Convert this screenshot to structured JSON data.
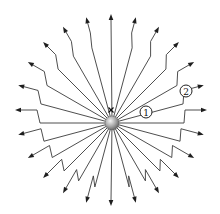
{
  "figure": {
    "labels": [
      {
        "id": "label-1",
        "text": "1",
        "display": "①",
        "cx": 146,
        "cy": 112
      },
      {
        "id": "label-2",
        "text": "2",
        "display": "②",
        "cx": 186,
        "cy": 91
      }
    ],
    "charge": {
      "cx": 112,
      "cy": 123,
      "r": 7
    },
    "old_position_mark": {
      "symbol": "×",
      "cx": 111,
      "cy": 110
    },
    "field_lines": {
      "count": 24,
      "angle_step_deg": 15,
      "tip_radius": 96,
      "kink_radius": 72,
      "colors": {
        "line": "#3a3a3a",
        "arrow": "#1e1e1e",
        "charge_light": "#f2f2f2",
        "charge_dark": "#6a6a6a"
      }
    }
  }
}
